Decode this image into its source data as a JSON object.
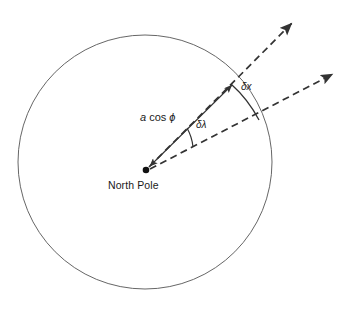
{
  "figure": {
    "title": "",
    "background_color": "#ffffff",
    "stroke_color": "#3a3a3a",
    "text_color": "#1a1a1a",
    "width": 353,
    "height": 312
  },
  "labels": {
    "north_pole": "North Pole",
    "radius_italic_a": "a",
    "radius_cos": " cos ",
    "radius_phi": "ϕ",
    "radius_full": "a cos ϕ",
    "delta_lambda": "δλ",
    "delta_x": "δx"
  },
  "geometry": {
    "circle": {
      "center_x": 145,
      "center_y": 162,
      "radius": 127,
      "stroke": "#555555",
      "stroke_width": 0.9,
      "fill": "none"
    },
    "pole_point": {
      "x": 146,
      "y": 170,
      "radius": 3.2,
      "fill": "#111111"
    },
    "ray_upper": {
      "from_x": 146,
      "from_y": 170,
      "to_x": 297,
      "to_y": 18,
      "style": "dashed",
      "arrowhead": "end"
    },
    "ray_lower": {
      "from_x": 146,
      "from_y": 170,
      "to_x": 338,
      "to_y": 70,
      "style": "dashed",
      "arrowhead": "end"
    },
    "radius_arrow": {
      "from_x": 146,
      "from_y": 170,
      "to_x": 234,
      "to_y": 83,
      "style": "solid",
      "arrowhead": "both"
    },
    "arc_delta_lambda": {
      "center_x": 146,
      "center_y": 170,
      "radius": 48,
      "style": "solid"
    },
    "arc_delta_x": {
      "style": "solid",
      "start_x": 232,
      "start_y": 84,
      "end_x": 258,
      "end_y": 119
    }
  },
  "label_positions": {
    "north_pole": {
      "x": 108,
      "y": 180
    },
    "radius": {
      "x": 142,
      "y": 114
    },
    "delta_lambda": {
      "x": 196,
      "y": 120
    },
    "delta_x": {
      "x": 240,
      "y": 82
    }
  }
}
